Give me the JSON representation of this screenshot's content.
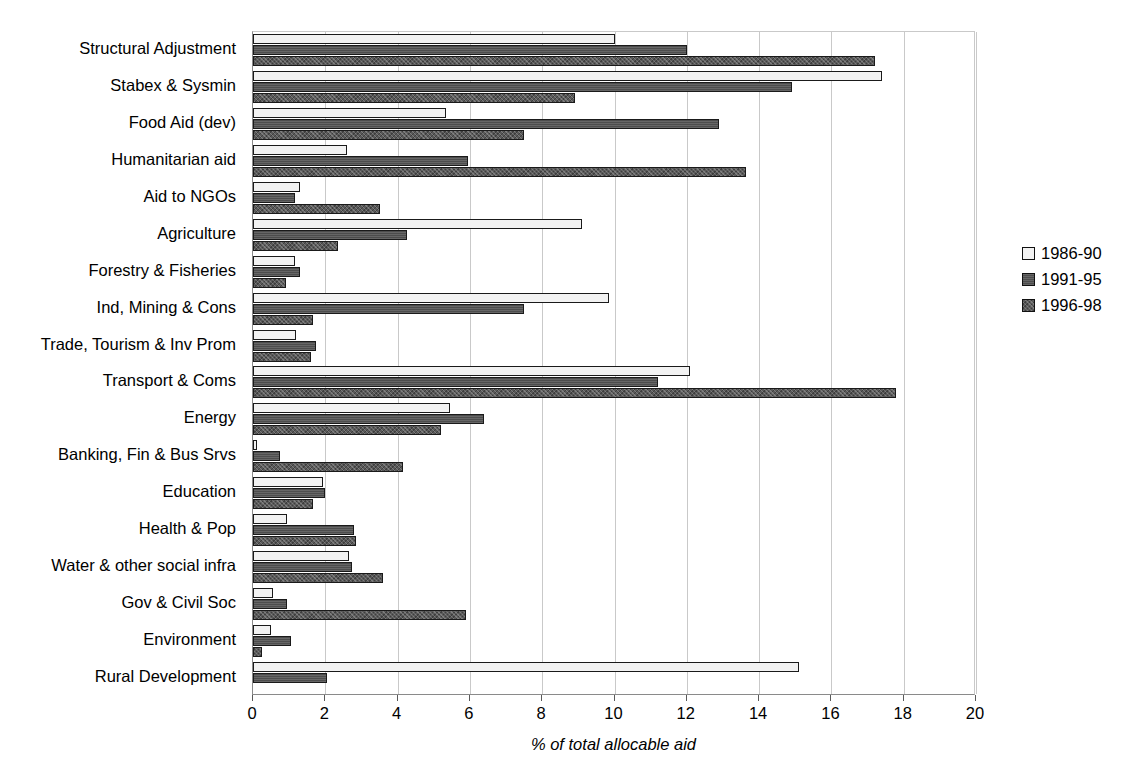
{
  "chart_data": {
    "type": "bar",
    "orientation": "horizontal",
    "title": "",
    "xlabel": "% of total allocable aid",
    "ylabel": "",
    "xlim": [
      0,
      20
    ],
    "xticks": [
      0,
      2,
      4,
      6,
      8,
      10,
      12,
      14,
      16,
      18,
      20
    ],
    "grid": "vertical",
    "legend_position": "right",
    "categories": [
      "Structural Adjustment",
      "Stabex & Sysmin",
      "Food Aid (dev)",
      "Humanitarian aid",
      "Aid to NGOs",
      "Agriculture",
      "Forestry & Fisheries",
      "Ind, Mining & Cons",
      "Trade, Tourism & Inv Prom",
      "Transport & Coms",
      "Energy",
      "Banking, Fin & Bus Srvs",
      "Education",
      "Health & Pop",
      "Water & other social infra",
      "Gov & Civil Soc",
      "Environment",
      "Rural Development"
    ],
    "series": [
      {
        "name": "1986-90",
        "color": "#f2f2f2",
        "values": [
          10.0,
          17.4,
          5.35,
          2.6,
          1.3,
          9.1,
          1.15,
          9.85,
          1.2,
          12.1,
          5.45,
          0.1,
          1.95,
          0.95,
          2.65,
          0.55,
          0.5,
          15.1
        ]
      },
      {
        "name": "1991-95",
        "color": "#4d4d4d",
        "values": [
          12.0,
          14.9,
          12.9,
          5.95,
          1.15,
          4.25,
          1.3,
          7.5,
          1.75,
          11.2,
          6.4,
          0.75,
          2.0,
          2.8,
          2.75,
          0.95,
          1.05,
          2.05
        ]
      },
      {
        "name": "1996-98",
        "color": "#595959",
        "values": [
          17.2,
          8.9,
          7.5,
          13.65,
          3.5,
          2.35,
          0.9,
          1.65,
          1.6,
          17.8,
          5.2,
          4.15,
          1.65,
          2.85,
          3.6,
          5.9,
          0.25,
          0.0
        ]
      }
    ]
  }
}
